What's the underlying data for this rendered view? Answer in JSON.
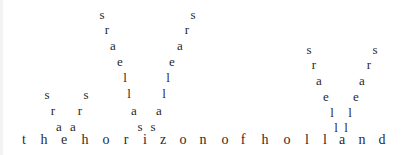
{
  "poem": {
    "title_line": "the horizon of holland",
    "baseline": [
      {
        "c": "t",
        "x": 24,
        "y": 140
      },
      {
        "c": "h",
        "x": 44,
        "y": 140
      },
      {
        "c": "e",
        "x": 64,
        "y": 140
      },
      {
        "c": "h",
        "x": 85,
        "y": 140
      },
      {
        "c": "o",
        "x": 106,
        "y": 140
      },
      {
        "c": "r",
        "x": 126,
        "y": 140
      },
      {
        "c": "i",
        "x": 145,
        "y": 140
      },
      {
        "c": "z",
        "x": 163,
        "y": 140
      },
      {
        "c": "o",
        "x": 183,
        "y": 140
      },
      {
        "c": "n",
        "x": 203,
        "y": 140
      },
      {
        "c": "o",
        "x": 225,
        "y": 140
      },
      {
        "c": "f",
        "x": 243,
        "y": 140
      },
      {
        "c": "h",
        "x": 265,
        "y": 140
      },
      {
        "c": "o",
        "x": 287,
        "y": 140
      },
      {
        "c": "l",
        "x": 307,
        "y": 140
      },
      {
        "c": "l",
        "x": 325,
        "y": 140
      },
      {
        "c": "a",
        "x": 342,
        "y": 140
      },
      {
        "c": "n",
        "x": 362,
        "y": 140
      },
      {
        "c": "d",
        "x": 382,
        "y": 140
      }
    ],
    "rising": [
      {
        "c": "s",
        "x": 47,
        "y": 94
      },
      {
        "c": "r",
        "x": 53,
        "y": 110
      },
      {
        "c": "a",
        "x": 59,
        "y": 126
      },
      {
        "c": "s",
        "x": 86,
        "y": 94
      },
      {
        "c": "r",
        "x": 80,
        "y": 110
      },
      {
        "c": "a",
        "x": 73,
        "y": 126
      },
      {
        "c": "s",
        "x": 102,
        "y": 14
      },
      {
        "c": "r",
        "x": 107,
        "y": 29
      },
      {
        "c": "a",
        "x": 113,
        "y": 45
      },
      {
        "c": "e",
        "x": 120,
        "y": 61
      },
      {
        "c": "l",
        "x": 125,
        "y": 77
      },
      {
        "c": "l",
        "x": 129,
        "y": 93
      },
      {
        "c": "a",
        "x": 134,
        "y": 110
      },
      {
        "c": "s",
        "x": 140,
        "y": 126
      },
      {
        "c": "s",
        "x": 193,
        "y": 14
      },
      {
        "c": "r",
        "x": 187,
        "y": 29
      },
      {
        "c": "a",
        "x": 180,
        "y": 45
      },
      {
        "c": "e",
        "x": 172,
        "y": 61
      },
      {
        "c": "l",
        "x": 168,
        "y": 77
      },
      {
        "c": "l",
        "x": 164,
        "y": 93
      },
      {
        "c": "a",
        "x": 159,
        "y": 110
      },
      {
        "c": "s",
        "x": 153,
        "y": 126
      },
      {
        "c": "s",
        "x": 309,
        "y": 49
      },
      {
        "c": "r",
        "x": 314,
        "y": 64
      },
      {
        "c": "a",
        "x": 319,
        "y": 80
      },
      {
        "c": "e",
        "x": 326,
        "y": 96
      },
      {
        "c": "l",
        "x": 332,
        "y": 112
      },
      {
        "c": "l",
        "x": 336,
        "y": 127
      },
      {
        "c": "s",
        "x": 375,
        "y": 49
      },
      {
        "c": "r",
        "x": 369,
        "y": 64
      },
      {
        "c": "a",
        "x": 362,
        "y": 80
      },
      {
        "c": "e",
        "x": 356,
        "y": 96
      },
      {
        "c": "l",
        "x": 350,
        "y": 112
      },
      {
        "c": "l",
        "x": 346,
        "y": 127
      }
    ]
  }
}
